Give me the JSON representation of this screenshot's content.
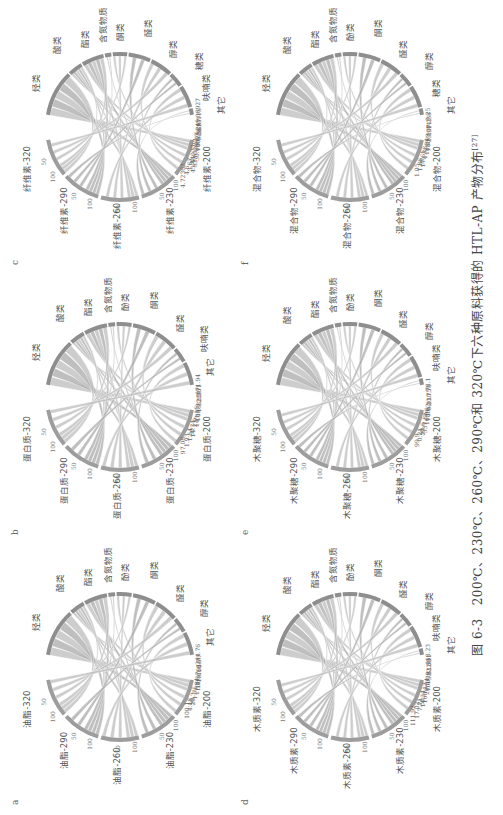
{
  "figure": {
    "caption_prefix": "图 6-3",
    "caption_text": "200℃、230℃、260℃、290℃和 320℃下六种原料获得的 HTL-AP 产物分布",
    "caption_ref": "[27]"
  },
  "panels": [
    {
      "letter": "a",
      "feedstock": "油脂",
      "temps": [
        "油脂-200",
        "油脂-230",
        "油脂-260",
        "油脂-290",
        "油脂-320"
      ],
      "products": [
        "烃类",
        "酸类",
        "酯类",
        "含氮物质",
        "酚类",
        "酮类",
        "醛类",
        "醇类",
        "其它"
      ],
      "values": [
        "244.76",
        "16.7",
        "166.7",
        "10.16",
        "11.57",
        "17.84",
        "1.75",
        "26.3",
        "4.18",
        "100.1"
      ]
    },
    {
      "letter": "b",
      "feedstock": "蛋白质",
      "temps": [
        "蛋白质-200",
        "蛋白质-230",
        "蛋白质-260",
        "蛋白质-290",
        "蛋白质-320"
      ],
      "products": [
        "烃类",
        "酸类",
        "酯类",
        "含氮物质",
        "酚类",
        "酮类",
        "醛类",
        "呋喃类",
        "其它"
      ],
      "values": [
        "171.94",
        "3.71",
        "82.36",
        "15.28",
        "1.53",
        "143.15",
        "2.9",
        "14.74",
        "1.54",
        "1.93",
        "97.08"
      ]
    },
    {
      "letter": "c",
      "feedstock": "纤维素",
      "temps": [
        "纤维素-200",
        "纤维素-230",
        "纤维素-260",
        "纤维素-290",
        "纤维素-320"
      ],
      "products": [
        "烃类",
        "酸类",
        "酯类",
        "含氮物质",
        "酮类",
        "醛类",
        "醇类",
        "糖类",
        "呋喃类",
        "其它"
      ],
      "values": [
        "245.06927",
        "0.13115",
        "26.97",
        "0.58",
        "0.62",
        "30.08807",
        "82.61533",
        "45.44073",
        "3.67",
        "4.6",
        "4.72362"
      ]
    },
    {
      "letter": "d",
      "feedstock": "木质素",
      "temps": [
        "木质素-200",
        "木质素-230",
        "木质素-260",
        "木质素-290",
        "木质素-320"
      ],
      "products": [
        "烃类",
        "酸类",
        "酯类",
        "含氮物质",
        "酚类",
        "酮类",
        "醛类",
        "醇类",
        "呋喃类",
        "其它"
      ],
      "values": [
        "118.23",
        "2.91",
        "82.08",
        "5.61",
        "74.39",
        "20.54",
        "160.17",
        "14.24",
        "7.71",
        "17.02",
        "111.92"
      ]
    },
    {
      "letter": "e",
      "feedstock": "木聚糖",
      "temps": [
        "木聚糖-200",
        "木聚糖-230",
        "木聚糖-260",
        "木聚糖-290",
        "木聚糖-320"
      ],
      "products": [
        "烃类",
        "酸类",
        "酯类",
        "含氮物质",
        "酚类",
        "酮类",
        "醛类",
        "醇类",
        "呋喃类",
        "其它"
      ],
      "values": [
        "78.1",
        "0.78",
        "20.75",
        "0.11",
        "1.62",
        "16.06",
        "337.88",
        "23.6",
        "0.21",
        "99.9"
      ]
    },
    {
      "letter": "f",
      "feedstock": "混合物",
      "temps": [
        "混合物-200",
        "混合物-230",
        "混合物-260",
        "混合物-290",
        "混合物-320"
      ],
      "products": [
        "烃类",
        "酸类",
        "酯类",
        "含氮物质",
        "酚类",
        "酮类",
        "醛类",
        "醇类",
        "糖类",
        "其它"
      ],
      "values": [
        "0.25",
        "14.38",
        "107.2",
        "23.97",
        "8.63",
        "18.31",
        "4.78",
        "17.61",
        "1.86",
        "1.05"
      ]
    }
  ],
  "ticks": [
    "0",
    "50",
    "100",
    "150",
    "200",
    "250",
    "300"
  ]
}
